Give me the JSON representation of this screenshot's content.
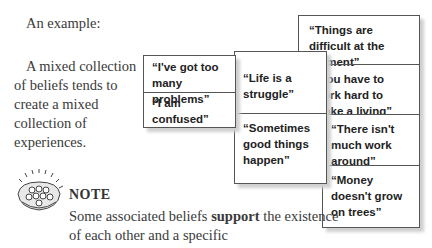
{
  "intro": "An example:",
  "paragraph": "A mixed collection of beliefs tends to create a mixed collection of experiences.",
  "boxes": {
    "left": [
      "“I've got too many problems”",
      "“I am confused”"
    ],
    "middle": [
      "“Life is a struggle”",
      "“Sometimes good things happen”"
    ],
    "right": [
      "“Things are difficult at the moment”",
      "“You have to work hard to make a living”",
      "“There isn't much work around”",
      "“Money doesn't grow on trees”"
    ]
  },
  "note": {
    "icon": "shell-icon",
    "heading": "NOTE",
    "text_before": "Some associated beliefs ",
    "text_bold": "support",
    "text_after": " the existence of each other and a specific"
  }
}
